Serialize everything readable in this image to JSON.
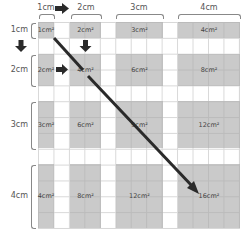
{
  "diagram": {
    "column_labels": [
      "1cm",
      "2cm",
      "3cm",
      "4cm"
    ],
    "row_labels": [
      "1cm",
      "2cm",
      "3cm",
      "4cm"
    ],
    "cells": [
      [
        "1cm²",
        "2cm²",
        "3cm²",
        "4cm²"
      ],
      [
        "2cm²",
        "4cm²",
        "6cm²",
        "8cm²"
      ],
      [
        "3cm²",
        "6cm²",
        "9cm²",
        "12cm²"
      ],
      [
        "4cm²",
        "8cm²",
        "12cm²",
        "16cm²"
      ]
    ],
    "arrows": [
      {
        "name": "right-arrow-header",
        "direction": "right",
        "between": "1cm column and 2cm column labels"
      },
      {
        "name": "down-arrow-row-labels",
        "direction": "down",
        "between": "1cm row and 2cm row labels"
      },
      {
        "name": "down-arrow-grid",
        "direction": "down",
        "position": "below 2cm² cell"
      },
      {
        "name": "right-arrow-grid",
        "direction": "right",
        "position": "between 2cm² and 4cm² cells"
      },
      {
        "name": "diagonal-arrow",
        "direction": "down-right",
        "from": "1cm²",
        "to": "16cm²"
      }
    ],
    "colors": {
      "cell_fill": "#c4c4c4",
      "grid_line": "#d8d8d8",
      "arrow": "#2a2a2a",
      "label_text": "#555555"
    }
  }
}
